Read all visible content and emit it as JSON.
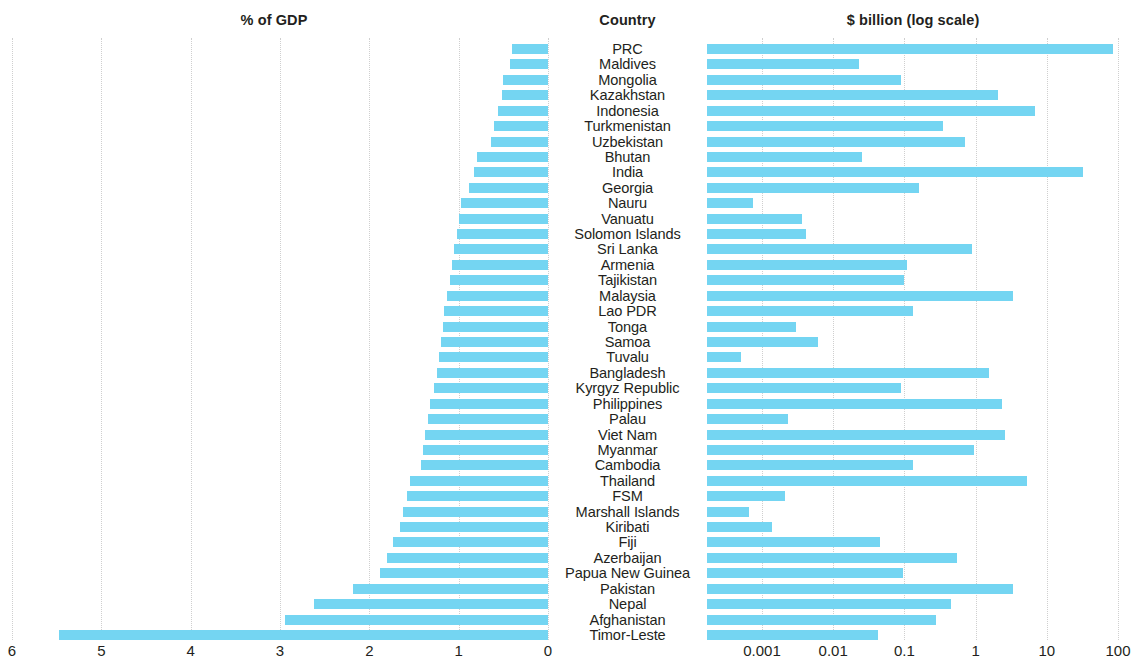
{
  "headers": {
    "left": "% of GDP",
    "center": "Country",
    "right": "$ billion (log scale)"
  },
  "colors": {
    "bar": "#74d5f2",
    "gridline": "#d9d9d9",
    "text": "#231f20",
    "background": "#ffffff"
  },
  "chart_data": {
    "type": "bar",
    "title": "",
    "subtitle": "",
    "orientation": "horizontal",
    "layout": "paired diverging panels with central category labels",
    "panels": [
      {
        "id": "left",
        "title": "% of GDP",
        "xlabel": "% of GDP",
        "ylabel": "Country",
        "scale": "linear",
        "direction": "right-to-left",
        "xlim": [
          0,
          6
        ],
        "ticks": [
          6,
          5,
          4,
          3,
          2,
          1,
          0
        ],
        "tick_labels": [
          "6",
          "5",
          "4",
          "3",
          "2",
          "1",
          "0"
        ],
        "grid": true
      },
      {
        "id": "right",
        "title": "$ billion (log scale)",
        "xlabel": "$ billion (log scale)",
        "ylabel": "Country",
        "scale": "log",
        "direction": "left-to-right",
        "xlim": [
          0.0002,
          200
        ],
        "ticks": [
          0.001,
          0.01,
          0.1,
          1,
          10,
          100
        ],
        "tick_labels": [
          "0.001",
          "0.01",
          "0.1",
          "1",
          "10",
          "100"
        ],
        "grid": true
      }
    ],
    "categories": [
      "PRC",
      "Maldives",
      "Mongolia",
      "Kazakhstan",
      "Indonesia",
      "Turkmenistan",
      "Uzbekistan",
      "Bhutan",
      "India",
      "Georgia",
      "Nauru",
      "Vanuatu",
      "Solomon Islands",
      "Sri Lanka",
      "Armenia",
      "Tajikistan",
      "Malaysia",
      "Lao PDR",
      "Tonga",
      "Samoa",
      "Tuvalu",
      "Bangladesh",
      "Kyrgyz Republic",
      "Philippines",
      "Palau",
      "Viet Nam",
      "Myanmar",
      "Cambodia",
      "Thailand",
      "FSM",
      "Marshall Islands",
      "Kiribati",
      "Fiji",
      "Azerbaijan",
      "Papua New Guinea",
      "Pakistan",
      "Nepal",
      "Afghanistan",
      "Timor-Leste"
    ],
    "series": [
      {
        "name": "% of GDP",
        "panel": "left",
        "unit": "%",
        "values": [
          0.4,
          0.42,
          0.5,
          0.52,
          0.56,
          0.6,
          0.64,
          0.8,
          0.83,
          0.88,
          0.97,
          1.0,
          1.02,
          1.05,
          1.08,
          1.1,
          1.13,
          1.16,
          1.18,
          1.2,
          1.22,
          1.24,
          1.28,
          1.32,
          1.34,
          1.38,
          1.4,
          1.42,
          1.55,
          1.58,
          1.62,
          1.66,
          1.74,
          1.8,
          1.88,
          2.18,
          2.62,
          2.94,
          5.47
        ]
      },
      {
        "name": "$ billion",
        "panel": "right",
        "unit": "$ billion",
        "values": [
          86.0,
          0.023,
          0.09,
          2.05,
          6.8,
          0.35,
          0.7,
          0.025,
          32.0,
          0.16,
          0.00075,
          0.0037,
          0.0042,
          0.9,
          0.11,
          0.1,
          3.4,
          0.13,
          0.003,
          0.0062,
          0.0005,
          1.55,
          0.09,
          2.35,
          0.0023,
          2.6,
          0.95,
          0.13,
          5.3,
          0.0021,
          0.00065,
          0.0014,
          0.045,
          0.55,
          0.095,
          3.3,
          0.45,
          0.28,
          0.042
        ]
      }
    ]
  }
}
